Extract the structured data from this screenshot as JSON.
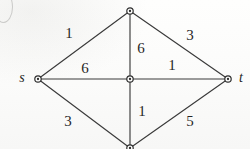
{
  "figure": {
    "kind": "weighted-undirected-graph",
    "background_color": "#fdfdfc",
    "stroke_color": "#3a3a3a",
    "label_color": "#262626"
  },
  "nodes": [
    {
      "id": "s",
      "label": "s",
      "label_shown": true,
      "x": 38,
      "y": 79,
      "name": "node-s"
    },
    {
      "id": "top",
      "label": "",
      "label_shown": false,
      "x": 130,
      "y": 11,
      "name": "node-top"
    },
    {
      "id": "center",
      "label": "",
      "label_shown": false,
      "x": 130,
      "y": 79,
      "name": "node-center"
    },
    {
      "id": "bottom",
      "label": "",
      "label_shown": false,
      "x": 130,
      "y": 148,
      "name": "node-bottom"
    },
    {
      "id": "t",
      "label": "t",
      "label_shown": true,
      "x": 228,
      "y": 79,
      "name": "node-t"
    }
  ],
  "node_terminals": [
    {
      "text": "s",
      "x": 22,
      "y": 78,
      "name": "terminal-label-s"
    },
    {
      "text": "t",
      "x": 241,
      "y": 78,
      "name": "terminal-label-t"
    }
  ],
  "edges": [
    {
      "from": "s",
      "to": "top",
      "weight": "1",
      "label_x": 69,
      "label_y": 33,
      "name": "edge-s-top"
    },
    {
      "from": "top",
      "to": "t",
      "weight": "3",
      "label_x": 190,
      "label_y": 35,
      "name": "edge-top-t"
    },
    {
      "from": "s",
      "to": "center",
      "weight": "6",
      "label_x": 85,
      "label_y": 68,
      "name": "edge-s-center"
    },
    {
      "from": "top",
      "to": "center",
      "weight": "6",
      "label_x": 141,
      "label_y": 48,
      "name": "edge-top-center"
    },
    {
      "from": "center",
      "to": "t",
      "weight": "1",
      "label_x": 172,
      "label_y": 65,
      "name": "edge-center-t"
    },
    {
      "from": "center",
      "to": "bottom",
      "weight": "1",
      "label_x": 142,
      "label_y": 111,
      "name": "edge-center-bottom"
    },
    {
      "from": "s",
      "to": "bottom",
      "weight": "3",
      "label_x": 68,
      "label_y": 121,
      "name": "edge-s-bottom"
    },
    {
      "from": "bottom",
      "to": "t",
      "weight": "5",
      "label_x": 190,
      "label_y": 121,
      "name": "edge-bottom-t"
    }
  ]
}
